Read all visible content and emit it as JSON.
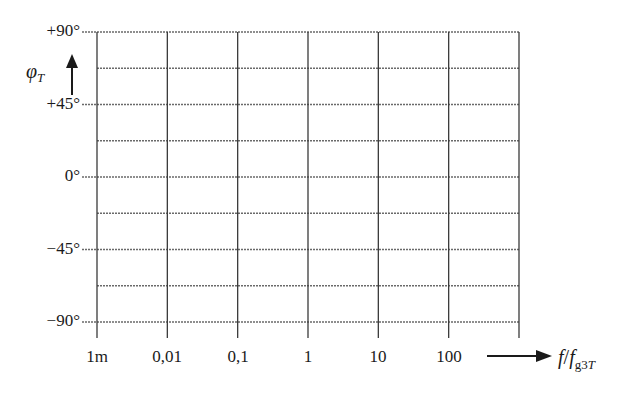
{
  "chart_data": {
    "type": "line",
    "title": "",
    "xlabel": "f/f_g3T",
    "ylabel": "φ_T",
    "x_scale": "log",
    "x_ticks": [
      "1m",
      "0,01",
      "0,1",
      "1",
      "10",
      "100"
    ],
    "x_tick_values": [
      0.001,
      0.01,
      0.1,
      1,
      10,
      100
    ],
    "y_ticks": [
      "+90°",
      "+45°",
      "0°",
      "−45°",
      "−90°"
    ],
    "y_tick_values": [
      90,
      45,
      0,
      -45,
      -90
    ],
    "ylim": [
      -90,
      90
    ],
    "grid": true,
    "grid_minor_y_step": 22.5,
    "series": [],
    "note": "Empty phase-response grid (blank template)"
  },
  "labels": {
    "y_ticks": [
      "+90°",
      "+45°",
      "0°",
      "−45°",
      "−90°"
    ],
    "x_ticks": [
      "1m",
      "0,01",
      "0,1",
      "1",
      "10",
      "100"
    ],
    "y_axis_symbol": "φ",
    "y_axis_sub": "T",
    "x_axis_f": "f",
    "x_axis_slash": "/",
    "x_axis_f2": "f",
    "x_axis_sub_g3": "g3",
    "x_axis_sub_T": "T"
  },
  "colors": {
    "grid": "#6a6a6a",
    "text": "#1a1a1a"
  }
}
